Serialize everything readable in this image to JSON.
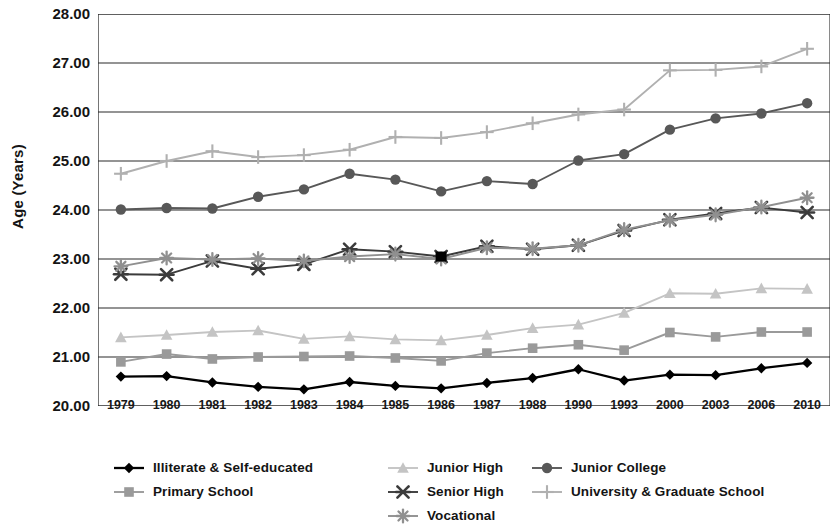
{
  "chart_data": {
    "type": "line",
    "title": "",
    "xlabel": "",
    "ylabel": "Age (Years)",
    "ylim": [
      20.0,
      28.0
    ],
    "ytick_step": 1.0,
    "ytick_labels": [
      "28.00",
      "27.00",
      "26.00",
      "25.00",
      "24.00",
      "23.00",
      "22.00",
      "21.00",
      "20.00"
    ],
    "grid": "horizontal",
    "legend_position": "bottom",
    "categories": [
      "1979",
      "1980",
      "1981",
      "1982",
      "1983",
      "1984",
      "1985",
      "1986",
      "1987",
      "1988",
      "1990",
      "1993",
      "2000",
      "2003",
      "2006",
      "2010"
    ],
    "series": [
      {
        "name": "Illiterate & Self-educated",
        "marker": "diamond",
        "color": "#000000",
        "values": [
          20.6,
          20.61,
          20.48,
          20.39,
          20.34,
          20.49,
          20.41,
          20.36,
          20.47,
          20.57,
          20.75,
          20.52,
          20.64,
          20.63,
          20.77,
          20.88
        ]
      },
      {
        "name": "Primary School",
        "marker": "square",
        "color": "#9a9a9a",
        "values": [
          20.9,
          21.06,
          20.96,
          21.0,
          21.01,
          21.02,
          20.98,
          20.92,
          21.08,
          21.18,
          21.25,
          21.14,
          21.5,
          21.41,
          21.51,
          21.51
        ]
      },
      {
        "name": "Junior High",
        "marker": "triangle",
        "color": "#c4c4c4",
        "values": [
          21.4,
          21.45,
          21.51,
          21.54,
          21.37,
          21.42,
          21.36,
          21.34,
          21.45,
          21.59,
          21.66,
          21.9,
          22.3,
          22.29,
          22.4,
          22.39
        ]
      },
      {
        "name": "Senior High",
        "marker": "cross-x",
        "color": "#3b3b3b",
        "values": [
          22.69,
          22.68,
          22.96,
          22.8,
          22.89,
          23.2,
          23.15,
          23.05,
          23.26,
          23.2,
          23.28,
          23.58,
          23.8,
          23.93,
          24.05,
          23.95
        ]
      },
      {
        "name": "Vocational",
        "marker": "asterisk",
        "color": "#909090",
        "values": [
          22.85,
          23.02,
          22.99,
          23.01,
          22.96,
          23.05,
          23.1,
          23.0,
          23.23,
          23.21,
          23.28,
          23.6,
          23.79,
          23.9,
          24.06,
          24.25
        ]
      },
      {
        "name": "Junior College",
        "marker": "circle",
        "color": "#585858",
        "values": [
          24.01,
          24.04,
          24.03,
          24.27,
          24.42,
          24.74,
          24.62,
          24.38,
          24.59,
          24.53,
          25.01,
          25.14,
          25.64,
          25.87,
          25.97,
          26.18
        ]
      },
      {
        "name": "University & Graduate School",
        "marker": "plus",
        "color": "#b0b0b0",
        "values": [
          24.74,
          25.0,
          25.2,
          25.08,
          25.12,
          25.23,
          25.49,
          25.47,
          25.59,
          25.77,
          25.95,
          26.05,
          26.85,
          26.86,
          26.93,
          27.29
        ]
      }
    ],
    "annotations": [
      {
        "name": "highlighted-point",
        "series": "Senior High",
        "category": "1986",
        "value": 23.05,
        "marker": "filled-square",
        "color": "#000000"
      }
    ],
    "legend_columns": [
      [
        "Illiterate & Self-educated",
        "Primary School"
      ],
      [
        "Junior High",
        "Senior High",
        "Vocational"
      ],
      [
        "Junior College",
        "University & Graduate School"
      ]
    ]
  }
}
